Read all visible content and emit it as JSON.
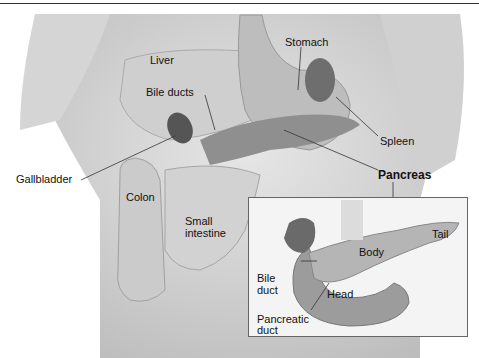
{
  "diagram": {
    "labels": {
      "liver": "Liver",
      "stomach": "Stomach",
      "bile_ducts": "Bile ducts",
      "spleen": "Spleen",
      "gallbladder": "Gallbladder",
      "pancreas": "Pancreas",
      "colon": "Colon",
      "small_intestine_1": "Small",
      "small_intestine_2": "intestine"
    },
    "inset": {
      "body": "Body",
      "tail": "Tail",
      "bile_duct_1": "Bile",
      "bile_duct_2": "duct",
      "head": "Head",
      "pancreatic_duct_1": "Pancreatic",
      "pancreatic_duct_2": "duct"
    }
  }
}
